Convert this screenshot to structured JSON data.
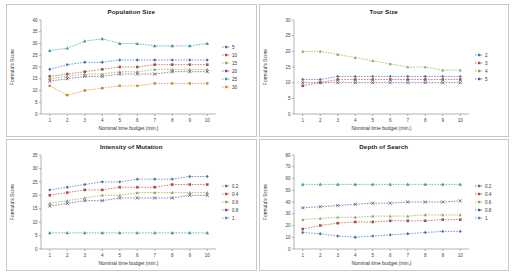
{
  "figure": {
    "panels": [
      {
        "title": "Population Size",
        "chart_data": {
          "type": "line",
          "title": "Population Size",
          "xlabel": "Nominal time budget (min.)",
          "ylabel": "Formula's Score",
          "x": [
            1,
            2,
            3,
            4,
            5,
            6,
            7,
            8,
            9,
            10
          ],
          "xlim": [
            0.5,
            10.5
          ],
          "ylim": [
            0,
            40
          ],
          "yticks": [
            0,
            5,
            10,
            15,
            20,
            25,
            30,
            35,
            40
          ],
          "grid": false,
          "legend_position": "right",
          "series": [
            {
              "name": "5",
              "values": [
                19,
                21,
                22,
                22,
                23,
                23,
                23,
                23,
                23,
                23
              ]
            },
            {
              "name": "10",
              "values": [
                16,
                17,
                18,
                19,
                20,
                20,
                21,
                21,
                21,
                21
              ]
            },
            {
              "name": "15",
              "values": [
                15,
                16,
                17,
                17,
                18,
                18,
                19,
                19,
                19,
                19
              ]
            },
            {
              "name": "20",
              "values": [
                14,
                15,
                16,
                16,
                17,
                17,
                17,
                18,
                18,
                18
              ]
            },
            {
              "name": "25",
              "values": [
                27,
                28,
                31,
                32,
                30,
                30,
                29,
                29,
                29,
                30
              ]
            },
            {
              "name": "30",
              "values": [
                12,
                8,
                10,
                11,
                12,
                12,
                13,
                13,
                13,
                13
              ]
            }
          ]
        }
      },
      {
        "title": "Tour Size",
        "chart_data": {
          "type": "line",
          "title": "Tour Size",
          "xlabel": "Nominal time budget (min.)",
          "ylabel": "Formula's Score",
          "x": [
            1,
            2,
            3,
            4,
            5,
            6,
            7,
            8,
            9,
            10
          ],
          "xlim": [
            0.5,
            10.5
          ],
          "ylim": [
            0,
            30
          ],
          "yticks": [
            0,
            5,
            10,
            15,
            20,
            25,
            30
          ],
          "grid": false,
          "legend_position": "right",
          "series": [
            {
              "name": "2",
              "values": [
                11,
                11,
                12,
                12,
                12,
                12,
                12,
                12,
                12,
                12
              ]
            },
            {
              "name": "3",
              "values": [
                9,
                10,
                11,
                11,
                11,
                11,
                11,
                11,
                11,
                11
              ]
            },
            {
              "name": "4",
              "values": [
                20,
                20,
                19,
                18,
                17,
                16,
                15,
                15,
                14,
                14
              ]
            },
            {
              "name": "5",
              "values": [
                10,
                10,
                10,
                10,
                10,
                10,
                10,
                10,
                10,
                10
              ]
            }
          ]
        }
      },
      {
        "title": "Intensity of Mutation",
        "chart_data": {
          "type": "line",
          "title": "Intensity of Mutation",
          "xlabel": "Nominal time budget (min.)",
          "ylabel": "Formula's Score",
          "x": [
            1,
            2,
            3,
            4,
            5,
            6,
            7,
            8,
            9,
            10
          ],
          "xlim": [
            0.5,
            10.5
          ],
          "ylim": [
            0,
            35
          ],
          "yticks": [
            0,
            5,
            10,
            15,
            20,
            25,
            30,
            35
          ],
          "grid": false,
          "legend_position": "right",
          "series": [
            {
              "name": "0.2",
              "values": [
                22,
                23,
                24,
                25,
                25,
                26,
                26,
                26,
                27,
                27
              ]
            },
            {
              "name": "0.4",
              "values": [
                20,
                21,
                22,
                22,
                23,
                23,
                23,
                24,
                24,
                24
              ]
            },
            {
              "name": "0.6",
              "values": [
                17,
                18,
                19,
                20,
                20,
                21,
                21,
                21,
                21,
                21
              ]
            },
            {
              "name": "0.8",
              "values": [
                16,
                17,
                18,
                18,
                19,
                19,
                19,
                19,
                20,
                20
              ]
            },
            {
              "name": "1",
              "values": [
                6,
                6,
                6,
                6,
                6,
                6,
                6,
                6,
                6,
                6
              ]
            }
          ]
        }
      },
      {
        "title": "Depth of Search",
        "chart_data": {
          "type": "line",
          "title": "Depth of Search",
          "xlabel": "Nominal time budget (min.)",
          "ylabel": "Formula's Score",
          "x": [
            1,
            2,
            3,
            4,
            5,
            6,
            7,
            8,
            9,
            10
          ],
          "xlim": [
            0.5,
            10.5
          ],
          "ylim": [
            0,
            80
          ],
          "yticks": [
            0,
            10,
            20,
            30,
            40,
            50,
            60,
            70,
            80
          ],
          "grid": false,
          "legend_position": "right",
          "series": [
            {
              "name": "0.2",
              "values": [
                14,
                13,
                11,
                10,
                11,
                12,
                13,
                14,
                15,
                15
              ]
            },
            {
              "name": "0.4",
              "values": [
                17,
                20,
                22,
                23,
                23,
                24,
                24,
                24,
                25,
                25
              ]
            },
            {
              "name": "0.6",
              "values": [
                25,
                26,
                27,
                27,
                28,
                28,
                28,
                29,
                29,
                29
              ]
            },
            {
              "name": "0.8",
              "values": [
                35,
                36,
                37,
                38,
                39,
                39,
                40,
                40,
                40,
                41
              ]
            },
            {
              "name": "1",
              "values": [
                55,
                55,
                55,
                55,
                55,
                55,
                55,
                55,
                55,
                55
              ]
            }
          ]
        }
      }
    ],
    "colors": {
      "series": [
        "#4472a8",
        "#b14b4b",
        "#8aa84b",
        "#6a4b8a",
        "#3d9aa8",
        "#d08a2a"
      ],
      "axis": "#808080",
      "text": "#333333"
    }
  }
}
